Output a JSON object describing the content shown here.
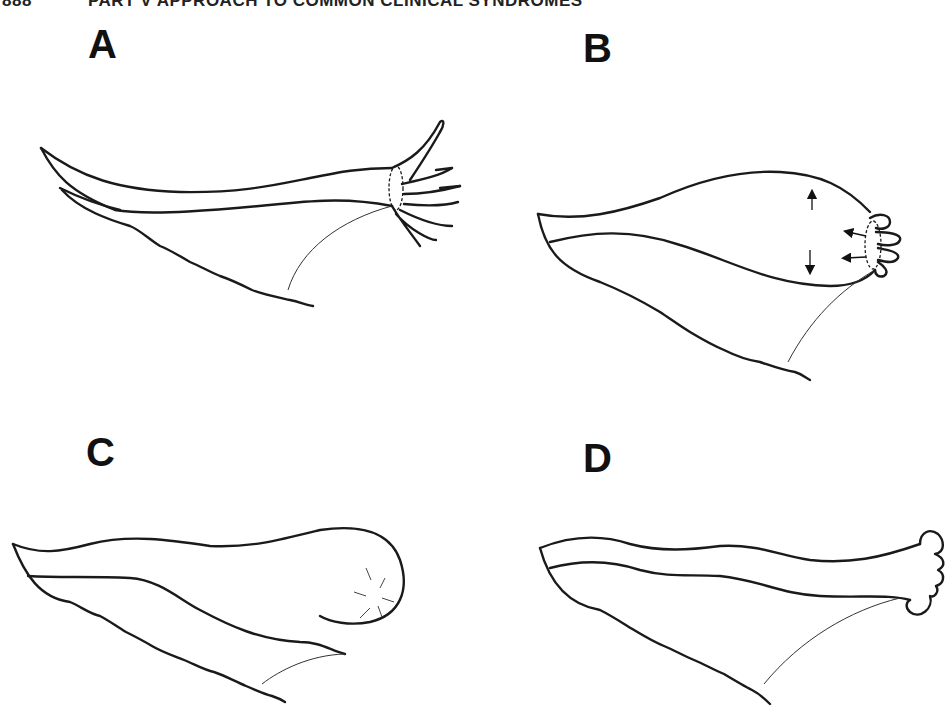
{
  "header": {
    "page_number": "888",
    "running_title": "PART V  APPROACH TO COMMON CLINICAL SYNDROMES",
    "note": "Header glyphs are clipped at the top edge; text inferred from partial letterforms, not confirmed."
  },
  "figure": {
    "panels": [
      {
        "id": "A",
        "label": "A",
        "description": "Normal fallopian tube with open fimbriated end"
      },
      {
        "id": "B",
        "label": "B",
        "description": "Distended tube with partially closed fimbriae; arrows indicating dilation"
      },
      {
        "id": "C",
        "label": "C",
        "description": "Club-shaped distended tube with completely occluded distal end"
      },
      {
        "id": "D",
        "label": "D",
        "description": "Tube with agglutinated, clubbed fimbriae"
      }
    ]
  },
  "colors": {
    "ink": "#1a1a1a",
    "background": "#ffffff"
  }
}
